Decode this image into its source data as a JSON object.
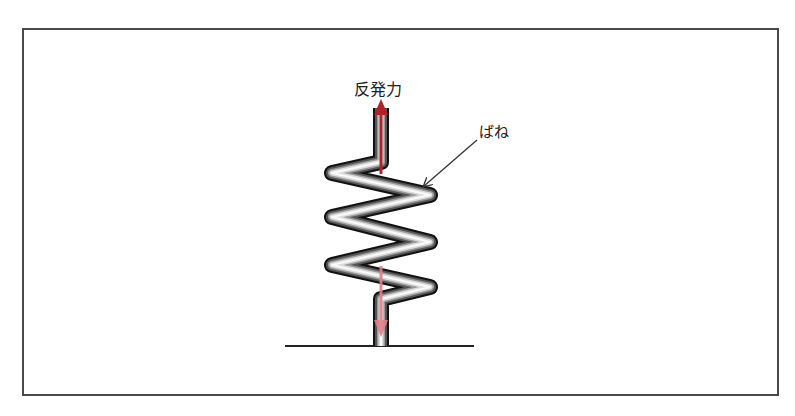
{
  "diagram": {
    "labels": {
      "reaction_force": "反発力",
      "spring": "ばね"
    },
    "colors": {
      "frame": "#4a4a4a",
      "spring_outline": "#111111",
      "spring_highlight": "#f4f4f4",
      "upper_arrow": "#b0222a",
      "lower_arrow": "#e07f85",
      "ground": "#222222",
      "leader_line": "#333333"
    },
    "elements": [
      {
        "type": "spring",
        "description": "zigzag coil spring standing on ground"
      },
      {
        "type": "arrow",
        "direction": "up",
        "meaning": "reaction force"
      },
      {
        "type": "arrow",
        "direction": "down",
        "meaning": "applied load into ground"
      },
      {
        "type": "line",
        "meaning": "ground"
      },
      {
        "type": "leader",
        "target": "spring"
      }
    ]
  }
}
